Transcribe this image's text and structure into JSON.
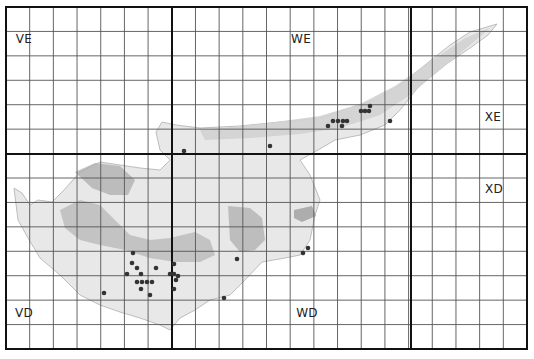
{
  "map": {
    "title": "Cyprus UTM grid distribution map",
    "grid": {
      "left": 6,
      "top": 7,
      "right": 527,
      "bottom": 349,
      "columns": 22,
      "rows": 14,
      "major_columns_at": [
        172,
        411
      ],
      "major_rows_at": [
        154
      ],
      "line_color": "#555555",
      "major_line_color": "#111111"
    },
    "square_labels": [
      {
        "text": "VE",
        "x": 24,
        "y": 39
      },
      {
        "text": "WE",
        "x": 301,
        "y": 39
      },
      {
        "text": "XE",
        "x": 493,
        "y": 117
      },
      {
        "text": "VD",
        "x": 24,
        "y": 313
      },
      {
        "text": "WD",
        "x": 307,
        "y": 313
      },
      {
        "text": "XD",
        "x": 494,
        "y": 189
      }
    ],
    "colors": {
      "land": "#e6e6e6",
      "land_edge": "#bdbdbd",
      "mountains": "#a9a9a9",
      "record_dot": "#333333"
    },
    "records": [
      [
        184,
        151
      ],
      [
        270,
        146
      ],
      [
        328,
        126
      ],
      [
        333,
        121
      ],
      [
        338,
        121
      ],
      [
        343,
        121
      ],
      [
        347,
        121
      ],
      [
        342,
        126
      ],
      [
        361,
        111
      ],
      [
        365,
        111
      ],
      [
        370,
        106
      ],
      [
        369,
        111
      ],
      [
        390,
        121
      ],
      [
        133,
        253
      ],
      [
        132,
        263
      ],
      [
        137,
        268
      ],
      [
        156,
        268
      ],
      [
        127,
        274
      ],
      [
        141,
        274
      ],
      [
        137,
        282
      ],
      [
        142,
        282
      ],
      [
        147,
        282
      ],
      [
        152,
        282
      ],
      [
        141,
        289
      ],
      [
        104,
        293
      ],
      [
        150,
        295
      ],
      [
        174,
        264
      ],
      [
        170,
        274
      ],
      [
        174,
        274
      ],
      [
        178,
        276
      ],
      [
        176,
        280
      ],
      [
        174,
        289
      ],
      [
        237,
        259
      ],
      [
        224,
        298
      ],
      [
        303,
        253
      ],
      [
        308,
        248
      ]
    ]
  }
}
